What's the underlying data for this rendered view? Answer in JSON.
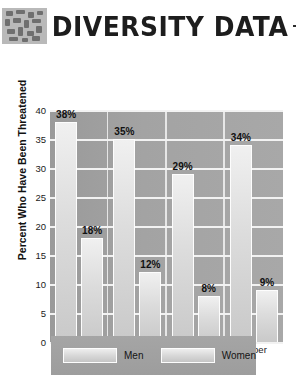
{
  "header": {
    "title": "DIVERSITY DATA",
    "logo_icon": "mosaic-tiles-icon",
    "rule_left": "",
    "rule_right": ""
  },
  "chart_data": {
    "type": "bar",
    "title": "",
    "xlabel": "Self-Reported Social Class",
    "ylabel": "Percent Who Have Been Threatened",
    "categories": [
      "Lower",
      "Working",
      "Middle",
      "Upper"
    ],
    "series": [
      {
        "name": "Men",
        "values": [
          38,
          35,
          29,
          34
        ],
        "labels": [
          "38%",
          "35%",
          "29%",
          "34%"
        ]
      },
      {
        "name": "Women",
        "values": [
          18,
          12,
          8,
          9
        ],
        "labels": [
          "18%",
          "12%",
          "8%",
          "9%"
        ]
      }
    ],
    "ylim": [
      0,
      40
    ],
    "yticks": [
      40,
      35,
      30,
      25,
      20,
      15,
      10,
      5,
      0
    ],
    "ytick_labels": [
      "40",
      "35",
      "30",
      "25",
      "20",
      "15",
      "10",
      "5",
      "0"
    ],
    "grid": true,
    "legend_position": "bottom",
    "colors": {
      "bar_light": "#e4e4e4",
      "plot_background": "#a3a3a3",
      "gridline": "#f2f2f2",
      "legend_background": "#a1a1a1",
      "text": "#111111"
    }
  },
  "legend": {
    "items": [
      {
        "label": "Men",
        "swatch": "men-swatch"
      },
      {
        "label": "Women",
        "swatch": "women-swatch"
      }
    ]
  }
}
